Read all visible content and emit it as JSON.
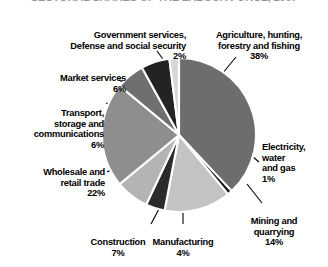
{
  "title": "SECTORAL SHARES OF THE LABOUR FORCE, 2007",
  "chart_data": {
    "type": "pie",
    "title": "SECTORAL SHARES OF THE LABOUR FORCE, 2007",
    "xlabel": "",
    "ylabel": "",
    "legend_position": "callout-labels",
    "grid": false,
    "unit": "%",
    "categories": [
      "Agriculture, hunting, forestry and fishing",
      "Electricity, water and gas",
      "Mining and quarrying",
      "Manufacturing",
      "Construction",
      "Wholesale and retail trade",
      "Transport, storage and communications",
      "Market services",
      "Government services, Defense and social security"
    ],
    "values": [
      38,
      1,
      14,
      4,
      7,
      22,
      6,
      6,
      2
    ],
    "colors": [
      "#6d6d6d",
      "#1a1a1a",
      "#c3c3c3",
      "#2b2b2b",
      "#b4b4b4",
      "#8e8e8e",
      "#6f6f6f",
      "#232323",
      "#d7d7d7"
    ],
    "slices": [
      {
        "name": "Agriculture, hunting, forestry and fishing",
        "label_line1": "Agriculture, hunting,",
        "label_line2": "forestry and fishing",
        "value": 38,
        "percent_text": "38%",
        "color": "#6d6d6d"
      },
      {
        "name": "Electricity, water and gas",
        "label_line1": "Electricity,",
        "label_line2": "water",
        "label_line3": "and gas",
        "value": 1,
        "percent_text": "1%",
        "color": "#1a1a1a"
      },
      {
        "name": "Mining and quarrying",
        "label_line1": "Mining and",
        "label_line2": "quarrying",
        "value": 14,
        "percent_text": "14%",
        "color": "#c3c3c3"
      },
      {
        "name": "Manufacturing",
        "label_line1": "Manufacturing",
        "value": 4,
        "percent_text": "4%",
        "color": "#2b2b2b"
      },
      {
        "name": "Construction",
        "label_line1": "Construction",
        "value": 7,
        "percent_text": "7%",
        "color": "#b4b4b4"
      },
      {
        "name": "Wholesale and retail trade",
        "label_line1": "Wholesale and",
        "label_line2": "retail trade",
        "value": 22,
        "percent_text": "22%",
        "color": "#8e8e8e"
      },
      {
        "name": "Transport, storage and communications",
        "label_line1": "Transport,",
        "label_line2": "storage and",
        "label_line3": "communications",
        "value": 6,
        "percent_text": "6%",
        "color": "#6f6f6f"
      },
      {
        "name": "Market services",
        "label_line1": "Market services",
        "value": 6,
        "percent_text": "6%",
        "color": "#232323"
      },
      {
        "name": "Government services, Defense and social security",
        "label_line1": "Government services,",
        "label_line2": "Defense and social security",
        "value": 2,
        "percent_text": "2%",
        "color": "#d7d7d7"
      }
    ]
  },
  "labels": {
    "agriculture": {
      "text": "Agriculture, hunting,\nforestry and fishing",
      "pct": "38%"
    },
    "government": {
      "text": "Government services,\nDefense and social security",
      "pct": "2%"
    },
    "market": {
      "text": "Market services",
      "pct": "6%"
    },
    "transport": {
      "text": "Transport,\nstorage and\ncommunications",
      "pct": "6%"
    },
    "wholesale": {
      "text": "Wholesale and\nretail trade",
      "pct": "22%"
    },
    "electricity": {
      "text": "Electricity,\nwater\nand gas",
      "pct": "1%"
    },
    "mining": {
      "text": "Mining and\nquarrying",
      "pct": "14%"
    },
    "manufacturing": {
      "text": "Manufacturing",
      "pct": "4%"
    },
    "construction": {
      "text": "Construction",
      "pct": "7%"
    }
  }
}
